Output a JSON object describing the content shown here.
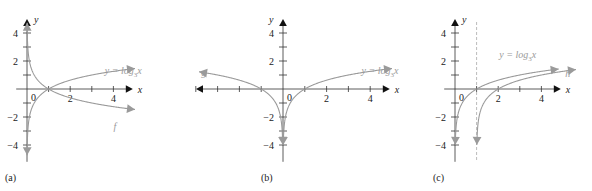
{
  "chart_data": [
    {
      "type": "line",
      "panel_label": "(a)",
      "xlabel": "x",
      "ylabel": "y",
      "xlim": [
        -0.5,
        4.9
      ],
      "ylim": [
        -5.2,
        5.0
      ],
      "x_ticks": [
        1,
        2,
        3,
        4
      ],
      "x_tick_labels": [
        {
          "value": 2,
          "text": "2"
        },
        {
          "value": 4,
          "text": "4"
        }
      ],
      "y_ticks": [
        -4,
        -3,
        -2,
        -1,
        1,
        2,
        3,
        4
      ],
      "y_tick_labels": [
        {
          "value": 4,
          "text": "4"
        },
        {
          "value": 2,
          "text": "2"
        },
        {
          "value": -2,
          "text": "-2"
        },
        {
          "value": -4,
          "text": "-4"
        }
      ],
      "origin_label": "0",
      "x_axis_left_arrow": false,
      "series": [
        {
          "name": "y = log3 x",
          "label": "y = log",
          "label_sub": "3",
          "label_tail": "x",
          "fn": "log3",
          "x_range": [
            0.0055,
            5.0
          ],
          "color": "#9a9a9a"
        },
        {
          "name": "f",
          "label": "f",
          "fn": "neglog3",
          "x_range": [
            0.0055,
            5.0
          ],
          "color": "#9a9a9a"
        }
      ]
    },
    {
      "type": "line",
      "panel_label": "(b)",
      "xlabel": "x",
      "ylabel": "y",
      "xlim": [
        -3.9,
        4.9
      ],
      "ylim": [
        -5.2,
        5.0
      ],
      "x_ticks": [
        -4,
        -3,
        -2,
        -1,
        1,
        2,
        3,
        4
      ],
      "x_tick_labels": [
        {
          "value": 2,
          "text": "2"
        },
        {
          "value": 4,
          "text": "4"
        }
      ],
      "y_ticks": [
        -4,
        -3,
        -2,
        -1,
        1,
        2,
        3,
        4
      ],
      "y_tick_labels": [
        {
          "value": 4,
          "text": "4"
        },
        {
          "value": 2,
          "text": "2"
        },
        {
          "value": -2,
          "text": "-2"
        },
        {
          "value": -4,
          "text": "-4"
        }
      ],
      "origin_label": "0",
      "x_axis_left_arrow": true,
      "series": [
        {
          "name": "y = log3 x",
          "label": "y = log",
          "label_sub": "3",
          "label_tail": "x",
          "fn": "log3",
          "x_range": [
            0.0125,
            5.0
          ],
          "color": "#9a9a9a"
        },
        {
          "name": "g",
          "label": "g",
          "fn": "log3neg",
          "x_range": [
            -3.85,
            -0.0125
          ],
          "color": "#9a9a9a"
        }
      ]
    },
    {
      "type": "line",
      "panel_label": "(c)",
      "xlabel": "x",
      "ylabel": "y",
      "xlim": [
        -0.5,
        4.9
      ],
      "ylim": [
        -5.2,
        5.0
      ],
      "x_ticks": [
        1,
        2,
        3,
        4
      ],
      "x_tick_labels": [
        {
          "value": 2,
          "text": "2"
        },
        {
          "value": 4,
          "text": "4"
        }
      ],
      "y_ticks": [
        -4,
        -3,
        -2,
        -1,
        1,
        2,
        3,
        4
      ],
      "y_tick_labels": [
        {
          "value": 4,
          "text": "4"
        },
        {
          "value": 2,
          "text": "2"
        },
        {
          "value": -2,
          "text": "-2"
        },
        {
          "value": -4,
          "text": "-4"
        }
      ],
      "origin_label": "0",
      "x_axis_left_arrow": false,
      "asymptote_x": 1,
      "series": [
        {
          "name": "y = log3 x",
          "label": "y = log",
          "label_sub": "3",
          "label_tail": "x",
          "fn": "log3",
          "x_range": [
            0.0125,
            4.8
          ],
          "color": "#9a9a9a"
        },
        {
          "name": "h",
          "label": "h",
          "fn": "log3shift1",
          "x_range": [
            1.0125,
            5.6
          ],
          "color": "#9a9a9a"
        }
      ]
    }
  ]
}
